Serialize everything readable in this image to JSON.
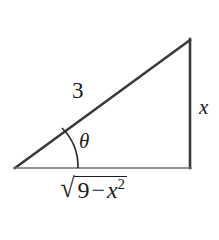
{
  "diagram": {
    "type": "right-triangle-trigonometry",
    "background_color": "#ffffff",
    "stroke_color": "#3a3a3a",
    "base_stroke_color": "#6e6e6e",
    "text_color": "#1b1b1b",
    "vertices": {
      "bottom_left": [
        15,
        168
      ],
      "bottom_right": [
        190,
        168
      ],
      "top_right": [
        190,
        40
      ]
    },
    "sides": {
      "hypotenuse": {
        "from": [
          15,
          168
        ],
        "to": [
          190,
          40
        ],
        "label": "3"
      },
      "opposite": {
        "from": [
          190,
          40
        ],
        "to": [
          190,
          168
        ],
        "label": "x"
      },
      "adjacent": {
        "from": [
          15,
          168
        ],
        "to": [
          190,
          168
        ],
        "label_radicand_lead": "9",
        "label_radicand_minus": "−",
        "label_radicand_var": "x",
        "label_radicand_exp": "2",
        "radical_sign": "√"
      }
    },
    "angle": {
      "label": "θ",
      "vertex": [
        15,
        168
      ],
      "arc_start": [
        62,
        128
      ],
      "arc_end": [
        78,
        168
      ]
    }
  }
}
